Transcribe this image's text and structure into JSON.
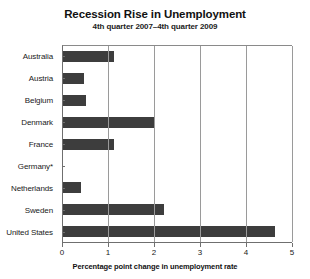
{
  "chart_data": {
    "type": "bar",
    "orientation": "horizontal",
    "title": "Recession Rise in Unemployment",
    "subtitle": "4th quarter 2007–4th quarter 2009",
    "xlabel": "Percentage point change in unemployment rate",
    "ylabel": "",
    "categories": [
      "Australia",
      "Austria",
      "Belgium",
      "Denmark",
      "France",
      "Germany*",
      "Netherlands",
      "Sweden",
      "United States"
    ],
    "values": [
      1.1,
      0.45,
      0.5,
      2.0,
      1.1,
      0.0,
      0.4,
      2.2,
      4.6
    ],
    "xlim": [
      0,
      5
    ],
    "xticks": [
      "0",
      "1",
      "2",
      "3",
      "4",
      "5"
    ],
    "xtick_values": [
      0,
      1,
      2,
      3,
      4,
      5
    ],
    "grid": "vertical",
    "legend": "none",
    "bar_color": "#3d3d3d",
    "axis_color": "#6f6f6f",
    "gridline_color": "#9a9a9a",
    "background": "#ffffff"
  }
}
